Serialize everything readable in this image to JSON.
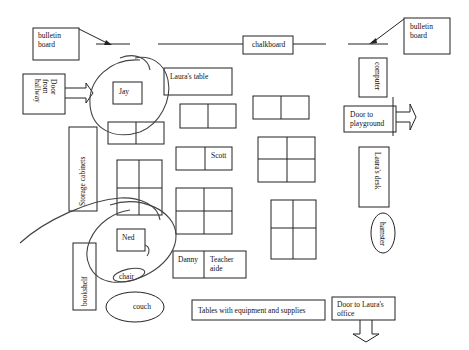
{
  "labels": {
    "bulletin_left": [
      "bulletin",
      "board"
    ],
    "bulletin_right": [
      "bulletin",
      "board"
    ],
    "chalkboard": "chalkboard",
    "door_hallway": [
      "Door",
      "from",
      "hallway"
    ],
    "jay": "Jay",
    "lauras_table": "Laura's table",
    "computer": "computer",
    "door_playground": [
      "Door to",
      "playground"
    ],
    "storage_cabinets": "Storage cabinets",
    "scott": "Scott",
    "lauras_desk": "Laura's desk",
    "hamster": "hamster",
    "ned": "Ned",
    "danny": "Danny",
    "teacher_aide": [
      "Teacher",
      "aide"
    ],
    "bookshelf": "bookshelf",
    "chair": "chair",
    "couch": "couch",
    "tables_equipment": "Tables with equipment and supplies",
    "door_office": [
      "Door to Laura's",
      "office"
    ]
  }
}
